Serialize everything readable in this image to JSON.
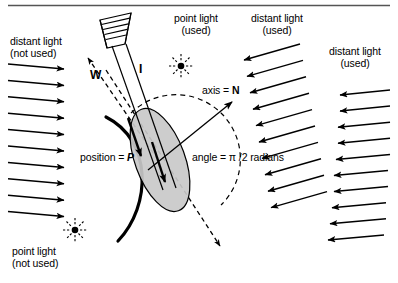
{
  "figure": {
    "background_color": "#ffffff",
    "line_color": "#000000",
    "ellipse_fill": "#cccccc",
    "top_rule": true
  },
  "labels": {
    "distant_light_left": {
      "line1": "distant light",
      "line2": "(not used)",
      "x": 10,
      "y": 41
    },
    "point_light_top": {
      "line1": "point light",
      "line2": "(used)",
      "x": 160,
      "y": 18
    },
    "distant_light_mid": {
      "line1": "distant light",
      "line2": "(used)",
      "x": 240,
      "y": 18
    },
    "distant_light_right": {
      "line1": "distant light",
      "line2": "(used)",
      "x": 318,
      "y": 50
    },
    "point_light_bottom": {
      "line1": "point light",
      "line2": "(not used)",
      "x": 12,
      "y": 249
    },
    "vector_w": {
      "text": "W",
      "x": 92,
      "y": 75
    },
    "vector_i": {
      "text": "I",
      "x": 138,
      "y": 70
    },
    "axis_n": {
      "prefix": "axis = ",
      "symbol": "N",
      "x": 203,
      "y": 90
    },
    "position_p": {
      "prefix": "position = ",
      "symbol": "P",
      "x": 81,
      "y": 156
    },
    "angle": {
      "text": "angle = π /2 radians",
      "x": 193,
      "y": 156
    }
  },
  "icons": {
    "spotlight": {
      "name": "spotlight-icon",
      "x": 97,
      "y": 13
    },
    "point_light_top_star": {
      "name": "point-light-starburst-icon",
      "cx": 181,
      "cy": 66
    },
    "point_light_bottom_star": {
      "name": "point-light-starburst-icon",
      "cx": 75,
      "cy": 230
    }
  },
  "arrow_groups": {
    "left": {
      "name": "distant-light-arrows-left",
      "label": "distant light (not used)",
      "count": 10,
      "direction": "right",
      "first_y": 66,
      "spacing": 16.4,
      "x_start": 8,
      "x_end": 64,
      "slope": 5
    },
    "middle": {
      "name": "distant-light-arrows-middle",
      "label": "distant light (used)",
      "count": 10,
      "direction": "left-down",
      "first_y": 58,
      "spacing": 16.4,
      "x_start": 305,
      "x_end": 245,
      "slope": 16
    },
    "right": {
      "name": "distant-light-arrows-right",
      "label": "distant light (used)",
      "count": 10,
      "direction": "left",
      "first_y": 95,
      "spacing": 16.1,
      "x_start": 388,
      "x_end": 338,
      "slope": 5
    }
  },
  "geometry": {
    "sphere_arc": "M 108 118 C 150 140 150 200 118 240",
    "dashed_arc_center": {
      "cx": 178,
      "cy": 162,
      "r": 63
    },
    "ellipse": {
      "cx": 160,
      "cy": 160,
      "rx": 26,
      "ry": 54,
      "rotation": -22
    },
    "normal_axis": {
      "x1": 150,
      "y1": 168,
      "x2": 232,
      "y2": 103
    },
    "incident_i": {
      "x1": 116,
      "y1": 40,
      "x2": 172,
      "y2": 198
    },
    "dashed_w": {
      "x1": 160,
      "y1": 162,
      "x2": 86,
      "y2": 56
    },
    "dashed_long": {
      "x1": 104,
      "y1": 68,
      "x2": 222,
      "y2": 248
    }
  }
}
